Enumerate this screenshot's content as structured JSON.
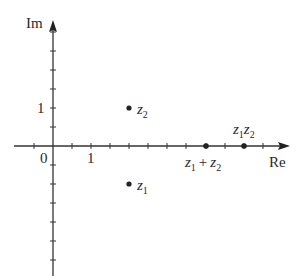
{
  "diagram": {
    "type": "complex-plane",
    "axes": {
      "real_label": "Re",
      "imag_label": "Im",
      "origin_label": "0",
      "real_tick_label": "1",
      "imag_tick_label": "1",
      "tick_step": 0.5
    },
    "points": [
      {
        "id": "z1",
        "label_main": "z",
        "label_sub": "1",
        "re": 2,
        "im": -1
      },
      {
        "id": "z2",
        "label_main": "z",
        "label_sub": "2",
        "re": 2,
        "im": 1
      },
      {
        "id": "sum",
        "label_a": "z",
        "label_a_sub": "1",
        "op": "+",
        "label_b": "z",
        "label_b_sub": "2",
        "re": 4,
        "im": 0
      },
      {
        "id": "product",
        "label_a": "z",
        "label_a_sub": "1",
        "label_b": "z",
        "label_b_sub": "2",
        "re": 5,
        "im": 0
      }
    ],
    "colors": {
      "axis": "#333333",
      "point": "#222222",
      "text": "#2a2a2a"
    }
  }
}
